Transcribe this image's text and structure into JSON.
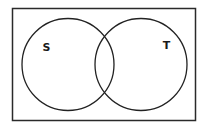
{
  "diagram": {
    "type": "venn",
    "universe": {
      "x": 12,
      "y": 8,
      "width": 184,
      "height": 113,
      "stroke": "#2a2a2a"
    },
    "sets": [
      {
        "label": "S",
        "cx": 68,
        "cy": 64,
        "r": 46,
        "label_x": 46,
        "label_y": 51
      },
      {
        "label": "T",
        "cx": 141,
        "cy": 64,
        "r": 46,
        "label_x": 166,
        "label_y": 49
      }
    ],
    "stroke_color": "#222222",
    "background": "#ffffff"
  }
}
